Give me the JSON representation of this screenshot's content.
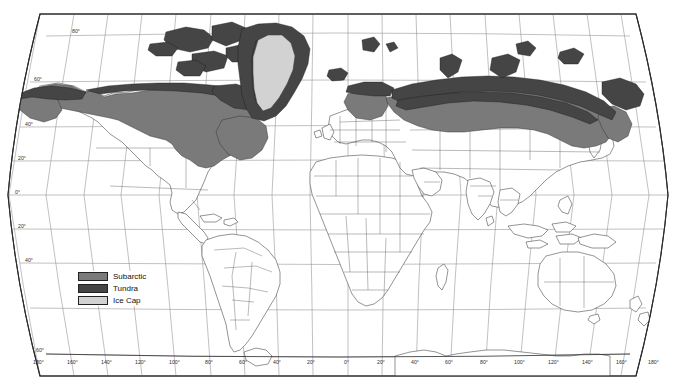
{
  "map": {
    "title": "World Climate Zones",
    "projection": "robinson",
    "background_color": "#ffffff",
    "frame_color": "#2b2b2b",
    "graticule_color": "#8d8d8d",
    "coastline_color": "#3a3a3a",
    "country_border_color": "#5a5a5a"
  },
  "legend": {
    "items": [
      {
        "label": "Subarctic",
        "color": "#7a7a7a"
      },
      {
        "label": "Tundra",
        "color": "#454545"
      },
      {
        "label": "Ice Cap",
        "color": "#d2d2d2"
      }
    ]
  },
  "axes": {
    "longitude_labels": [
      "180°",
      "160°",
      "140°",
      "120°",
      "100°",
      "80°",
      "60°",
      "40°",
      "20°",
      "0°",
      "20°",
      "40°",
      "60°",
      "80°",
      "100°",
      "120°",
      "140°",
      "160°",
      "180°"
    ],
    "longitude_values": [
      -180,
      -160,
      -140,
      -120,
      -100,
      -80,
      -60,
      -40,
      -20,
      0,
      20,
      40,
      60,
      80,
      100,
      120,
      140,
      160,
      180
    ],
    "latitude_labels": [
      "80°",
      "60°",
      "40°",
      "20°",
      "0°",
      "20°",
      "40°",
      "60°"
    ],
    "latitude_values": [
      80,
      60,
      40,
      20,
      0,
      -20,
      -40,
      -60
    ]
  },
  "zones": {
    "subarctic_regions": [
      "Alaska",
      "Northern Canada",
      "Scandinavia",
      "Siberia"
    ],
    "tundra_regions": [
      "Arctic Canada",
      "Canadian Arctic Archipelago",
      "Greenland coast",
      "Northern Siberia",
      "Svalbard",
      "Iceland north"
    ],
    "ice_cap_regions": [
      "Greenland interior"
    ]
  }
}
